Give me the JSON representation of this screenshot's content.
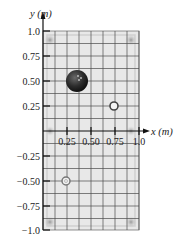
{
  "figure": {
    "y_axis_label": "y (m)",
    "x_axis_label": "x (m)",
    "y_ticks": [
      {
        "value": 1.0,
        "label": "1.0"
      },
      {
        "value": 0.75,
        "label": "0.75"
      },
      {
        "value": 0.5,
        "label": "0.50"
      },
      {
        "value": 0.25,
        "label": "0.25"
      },
      {
        "value": -0.25,
        "label": "−0.25"
      },
      {
        "value": -0.5,
        "label": "−0.50"
      },
      {
        "value": -0.75,
        "label": "−0.75"
      },
      {
        "value": -1.0,
        "label": "−1.0"
      }
    ],
    "x_ticks": [
      {
        "value": 0.25,
        "label": "0.25"
      },
      {
        "value": 0.5,
        "label": "0.50"
      },
      {
        "value": 0.75,
        "label": "0.75"
      },
      {
        "value": 1.0,
        "label": "1.0"
      }
    ],
    "objects": [
      {
        "name": "bowling-ball",
        "x": 0.25,
        "y": 0.5,
        "kind": "large-ball"
      },
      {
        "name": "small-ring-1",
        "x": 0.75,
        "y": 0.25,
        "kind": "ring"
      },
      {
        "name": "small-ring-2",
        "x": 0.25,
        "y": -0.5,
        "kind": "ring"
      }
    ],
    "colors": {
      "table": "#e6e6e6",
      "grid": "#555555",
      "axis": "#111111",
      "ball": "#2a2a2a"
    }
  }
}
